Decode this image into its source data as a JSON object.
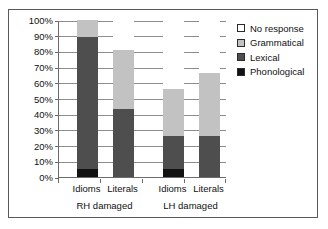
{
  "chart_data": {
    "type": "bar",
    "subtype": "stacked-100-percent",
    "title": "",
    "xlabel": "",
    "ylabel": "",
    "ylim": [
      0,
      100
    ],
    "yunit": "%",
    "grid": true,
    "legend_position": "right",
    "categories": [
      "Idioms",
      "Literals",
      "Idioms",
      "Literals"
    ],
    "groups": [
      {
        "label": "RH damaged",
        "categories": [
          "Idioms",
          "Literals"
        ]
      },
      {
        "label": "LH damaged",
        "categories": [
          "Idioms",
          "Literals"
        ]
      }
    ],
    "ytick_labels": [
      "0%",
      "10%",
      "20%",
      "30%",
      "40%",
      "50%",
      "60%",
      "70%",
      "80%",
      "90%",
      "100%"
    ],
    "ytick_values": [
      0,
      10,
      20,
      30,
      40,
      50,
      60,
      70,
      80,
      90,
      100
    ],
    "series": [
      {
        "name": "Phonological",
        "color": "#121212",
        "values": [
          5,
          0,
          5,
          0
        ]
      },
      {
        "name": "Lexical",
        "color": "#4e4e4e",
        "values": [
          84,
          43,
          21,
          26
        ]
      },
      {
        "name": "Grammatical",
        "color": "#c2c2c2",
        "values": [
          11,
          38,
          30,
          40
        ]
      },
      {
        "name": "No response",
        "color": "#ffffff",
        "values": [
          0,
          19,
          44,
          34
        ]
      }
    ],
    "bars": [
      {
        "group": "RH damaged",
        "category": "Idioms",
        "segments": [
          {
            "name": "Phonological",
            "value": 5,
            "from": 0,
            "to": 5
          },
          {
            "name": "Lexical",
            "value": 84,
            "from": 5,
            "to": 89
          },
          {
            "name": "Grammatical",
            "value": 11,
            "from": 89,
            "to": 100
          },
          {
            "name": "No response",
            "value": 0,
            "from": 100,
            "to": 100
          }
        ]
      },
      {
        "group": "RH damaged",
        "category": "Literals",
        "segments": [
          {
            "name": "Phonological",
            "value": 0,
            "from": 0,
            "to": 0
          },
          {
            "name": "Lexical",
            "value": 43,
            "from": 0,
            "to": 43
          },
          {
            "name": "Grammatical",
            "value": 38,
            "from": 43,
            "to": 81
          },
          {
            "name": "No response",
            "value": 19,
            "from": 81,
            "to": 100
          }
        ]
      },
      {
        "group": "LH damaged",
        "category": "Idioms",
        "segments": [
          {
            "name": "Phonological",
            "value": 5,
            "from": 0,
            "to": 5
          },
          {
            "name": "Lexical",
            "value": 21,
            "from": 5,
            "to": 26
          },
          {
            "name": "Grammatical",
            "value": 30,
            "from": 26,
            "to": 56
          },
          {
            "name": "No response",
            "value": 44,
            "from": 56,
            "to": 100
          }
        ]
      },
      {
        "group": "LH damaged",
        "category": "Literals",
        "segments": [
          {
            "name": "Phonological",
            "value": 0,
            "from": 0,
            "to": 0
          },
          {
            "name": "Lexical",
            "value": 26,
            "from": 0,
            "to": 26
          },
          {
            "name": "Grammatical",
            "value": 40,
            "from": 26,
            "to": 66
          },
          {
            "name": "No response",
            "value": 34,
            "from": 66,
            "to": 100
          }
        ]
      }
    ],
    "legend": [
      {
        "label": "No response",
        "color": "#ffffff",
        "key": "none"
      },
      {
        "label": "Grammatical",
        "color": "#c2c2c2",
        "key": "gram"
      },
      {
        "label": "Lexical",
        "color": "#4e4e4e",
        "key": "lex"
      },
      {
        "label": "Phonological",
        "color": "#121212",
        "key": "phon"
      }
    ]
  }
}
